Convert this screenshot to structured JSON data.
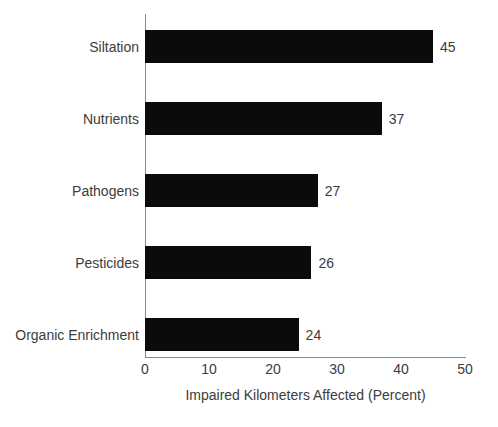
{
  "chart_data": {
    "type": "bar",
    "orientation": "horizontal",
    "title": "",
    "subtitle": "",
    "xlabel": "Impaired Kilometers Affected (Percent)",
    "ylabel": "",
    "categories": [
      "Siltation",
      "Nutrients",
      "Pathogens",
      "Pesticides",
      "Organic Enrichment"
    ],
    "values": [
      45,
      37,
      27,
      26,
      24
    ],
    "value_labels": [
      "45",
      "37",
      "27",
      "26",
      "24"
    ],
    "xlim": [
      0,
      50
    ],
    "xticks": [
      0,
      10,
      20,
      30,
      40,
      50
    ],
    "xtick_labels": [
      "0",
      "10",
      "20",
      "30",
      "40",
      "50"
    ],
    "grid": false,
    "legend": false,
    "legend_position": "none",
    "bar_color": "#0b0b0b",
    "axis_color": "#8b8b8b",
    "text_color": "#3c3c3c",
    "background_color": "#ffffff"
  },
  "bottom_caption": ""
}
